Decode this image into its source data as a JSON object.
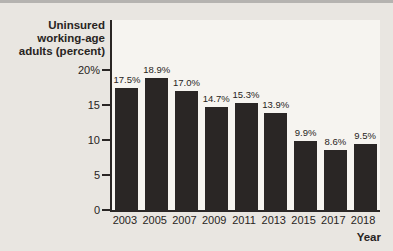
{
  "chart_data": {
    "type": "bar",
    "title": "Uninsured working-age adults (percent)",
    "title_lines": [
      "Uninsured",
      "working-age",
      "adults (percent)"
    ],
    "xlabel": "Year",
    "ylabel": "Uninsured working-age adults (percent)",
    "categories": [
      "2003",
      "2005",
      "2007",
      "2009",
      "2011",
      "2013",
      "2015",
      "2017",
      "2018"
    ],
    "values": [
      17.5,
      18.9,
      17.0,
      14.7,
      15.3,
      13.9,
      9.9,
      8.6,
      9.5
    ],
    "value_labels": [
      "17.5%",
      "18.9%",
      "17.0%",
      "14.7%",
      "15.3%",
      "13.9%",
      "9.9%",
      "8.6%",
      "9.5%"
    ],
    "ylim": [
      0,
      20
    ],
    "yticks": [
      0,
      5,
      10,
      15,
      20
    ],
    "ytick_labels": [
      "0",
      "5",
      "10",
      "15",
      "20%"
    ],
    "grid": false,
    "legend": null
  },
  "colors": {
    "page_bg": "#e9e6e1",
    "plot_bg": "#f6f4f0",
    "bar": "#2a2625",
    "axis": "#2a2625",
    "text": "#282422",
    "top_band": "#b5b3b0"
  }
}
